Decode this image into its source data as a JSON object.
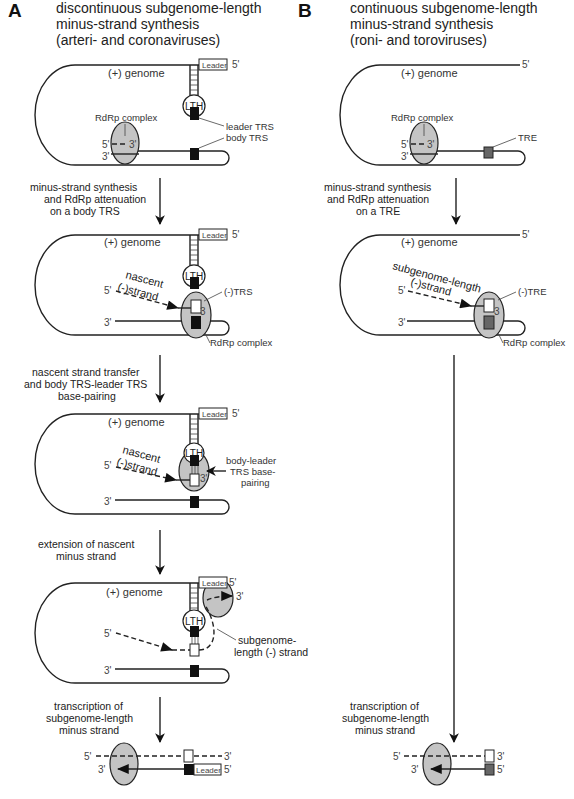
{
  "panel_a": {
    "letter": "A",
    "title": [
      "discontinuous subgenome-length",
      "minus-strand synthesis",
      "(arteri- and coronaviruses)"
    ],
    "stages": [
      {
        "genome_label": "(+) genome",
        "leader_label": "Leader",
        "five_prime": "5'",
        "lth_label": "LTH",
        "rdrp_label": "RdRp complex",
        "leader_trs_label": "leader TRS",
        "body_trs_label": "body TRS",
        "end5": "5'",
        "end3": "3'",
        "end3b": "3'"
      },
      {
        "step_text": [
          "minus-strand synthesis",
          "and RdRp attenuation",
          "on a body TRS"
        ],
        "genome_label": "(+) genome",
        "leader_label": "Leader",
        "five_prime": "5'",
        "lth_label": "LTH",
        "nascent_label": [
          "nascent",
          "(-)strand"
        ],
        "neg_trs_label": "(-)TRS",
        "rdrp_label": "RdRp complex",
        "end5": "5'",
        "end3": "3'",
        "end3b": "3"
      },
      {
        "step_text": [
          "nascent strand transfer",
          "and body TRS-leader TRS",
          "base-pairing"
        ],
        "genome_label": "(+) genome",
        "leader_label": "Leader",
        "five_prime": "5'",
        "lth_label": "LTH",
        "nascent_label": [
          "nascent",
          "(-)strand"
        ],
        "pairing_label": [
          "body-leader",
          "TRS base-",
          "pairing"
        ],
        "end5": "5'",
        "end3": "3'",
        "end3b": "3'"
      },
      {
        "step_text": [
          "extension of nascent",
          "minus strand"
        ],
        "genome_label": "(+) genome",
        "leader_label": "Leader",
        "five_prime": "5'",
        "three_prime": "3'",
        "lth_label": "LTH",
        "sg_label": [
          "subgenome-",
          "length (-) strand"
        ],
        "end5": "5'",
        "end3": "3'"
      },
      {
        "step_text": [
          "transcription of",
          "subgenome-length",
          "minus strand"
        ],
        "leader_label": "Leader",
        "top_5": "5'",
        "top_3": "3'",
        "bot_3": "3'",
        "bot_5": "5'"
      }
    ]
  },
  "panel_b": {
    "letter": "B",
    "title": [
      "continuous subgenome-length",
      "minus-strand synthesis",
      "(roni- and toroviruses)"
    ],
    "stages": [
      {
        "genome_label": "(+) genome",
        "five_prime": "5'",
        "rdrp_label": "RdRp complex",
        "tre_label": "TRE",
        "end5": "5'",
        "end3": "3'",
        "end3b": "3'"
      },
      {
        "step_text": [
          "minus-strand synthesis",
          "and RdRp attenuation",
          "on a TRE"
        ],
        "genome_label": "(+) genome",
        "five_prime": "5'",
        "sg_label": [
          "subgenome-length",
          "(-)strand"
        ],
        "neg_tre_label": "(-)TRE",
        "rdrp_label": "RdRp complex",
        "end5": "5'",
        "end3": "3'",
        "end3b": "3"
      },
      {
        "step_text": [
          "transcription of",
          "subgenome-length",
          "minus strand"
        ],
        "top_5": "5'",
        "top_3": "3'",
        "bot_3": "3'",
        "bot_5": "5'"
      }
    ]
  },
  "colors": {
    "line": "#222222",
    "rdrp_fill": "#c4c4c4",
    "trs_fill": "#111111",
    "tre_fill": "#666666"
  }
}
